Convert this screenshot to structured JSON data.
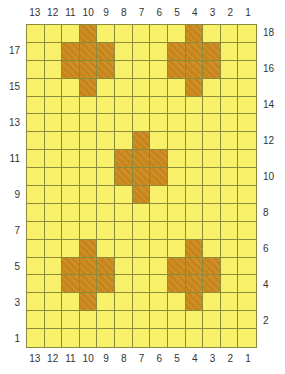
{
  "chart_data": {
    "type": "heatmap",
    "title": "",
    "xlabel": "",
    "ylabel": "",
    "columns": 13,
    "rows": 18,
    "column_labels_top": [
      "13",
      "12",
      "11",
      "10",
      "9",
      "8",
      "7",
      "6",
      "5",
      "4",
      "3",
      "2",
      "1"
    ],
    "column_labels_bottom": [
      "13",
      "12",
      "11",
      "10",
      "9",
      "8",
      "7",
      "6",
      "5",
      "4",
      "3",
      "2",
      "1"
    ],
    "row_labels_left": [
      "17",
      "15",
      "13",
      "11",
      "9",
      "7",
      "5",
      "3",
      "1"
    ],
    "row_labels_right": [
      "18",
      "16",
      "14",
      "12",
      "10",
      "8",
      "6",
      "4",
      "2"
    ],
    "legend": [],
    "colors": {
      "background": "#f9f06a",
      "motif": "#c7851a",
      "gridline": "#8a8a3a",
      "label_text": "#333333",
      "page_background": "#ffffff"
    },
    "grid": [
      [
        0,
        0,
        0,
        1,
        0,
        0,
        0,
        0,
        0,
        1,
        0,
        0,
        0
      ],
      [
        0,
        0,
        1,
        1,
        1,
        0,
        0,
        0,
        1,
        1,
        1,
        0,
        0
      ],
      [
        0,
        0,
        1,
        1,
        1,
        0,
        0,
        0,
        1,
        1,
        1,
        0,
        0
      ],
      [
        0,
        0,
        0,
        1,
        0,
        0,
        0,
        0,
        0,
        1,
        0,
        0,
        0
      ],
      [
        0,
        0,
        0,
        0,
        0,
        0,
        0,
        0,
        0,
        0,
        0,
        0,
        0
      ],
      [
        0,
        0,
        0,
        0,
        0,
        0,
        0,
        0,
        0,
        0,
        0,
        0,
        0
      ],
      [
        0,
        0,
        0,
        0,
        0,
        0,
        1,
        0,
        0,
        0,
        0,
        0,
        0
      ],
      [
        0,
        0,
        0,
        0,
        0,
        1,
        1,
        1,
        0,
        0,
        0,
        0,
        0
      ],
      [
        0,
        0,
        0,
        0,
        0,
        1,
        1,
        1,
        0,
        0,
        0,
        0,
        0
      ],
      [
        0,
        0,
        0,
        0,
        0,
        0,
        1,
        0,
        0,
        0,
        0,
        0,
        0
      ],
      [
        0,
        0,
        0,
        0,
        0,
        0,
        0,
        0,
        0,
        0,
        0,
        0,
        0
      ],
      [
        0,
        0,
        0,
        0,
        0,
        0,
        0,
        0,
        0,
        0,
        0,
        0,
        0
      ],
      [
        0,
        0,
        0,
        1,
        0,
        0,
        0,
        0,
        0,
        1,
        0,
        0,
        0
      ],
      [
        0,
        0,
        1,
        1,
        1,
        0,
        0,
        0,
        1,
        1,
        1,
        0,
        0
      ],
      [
        0,
        0,
        1,
        1,
        1,
        0,
        0,
        0,
        1,
        1,
        1,
        0,
        0
      ],
      [
        0,
        0,
        0,
        1,
        0,
        0,
        0,
        0,
        0,
        1,
        0,
        0,
        0
      ],
      [
        0,
        0,
        0,
        0,
        0,
        0,
        0,
        0,
        0,
        0,
        0,
        0,
        0
      ],
      [
        0,
        0,
        0,
        0,
        0,
        0,
        0,
        0,
        0,
        0,
        0,
        0,
        0
      ]
    ]
  }
}
